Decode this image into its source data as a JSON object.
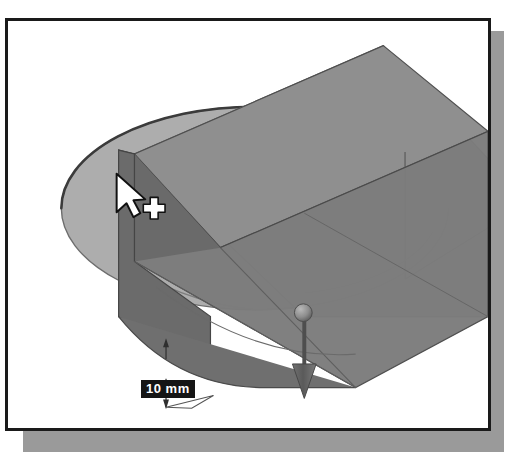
{
  "app": {
    "title": "3D CAD modeling viewport",
    "kind": "cad-extrude-preview"
  },
  "viewport": {
    "background_color": "#ffffff",
    "frame_color": "#1a1a1a",
    "shadow_color": "#9a9a9a"
  },
  "dimension": {
    "value_label": "10 mm",
    "value": 10,
    "units": "mm",
    "label_background": "#151515",
    "label_text_color": "#ffffff"
  },
  "model": {
    "sketch_name": "circle-profile",
    "feature_name": "extruded-slab",
    "face_colors": {
      "circle_face": "#adadad",
      "slab_top_light": "#b5b5b5",
      "slab_top_dark": "#8f8f8f",
      "slab_front_dark": "#6f6f6f",
      "slab_front_mid": "#7e7e7e",
      "slab_side_darkest": "#656565",
      "edge_line": "#3a3a3a",
      "hidden_edge": "#8a8a8a"
    }
  },
  "handle": {
    "name": "extrude-drag-arrow",
    "direction": "down",
    "color": "#5e5e5e",
    "ball_color": "#888888"
  },
  "cursor": {
    "name": "select-pointer-with-crosshair",
    "fill": "#ffffff",
    "outline": "#111111"
  }
}
